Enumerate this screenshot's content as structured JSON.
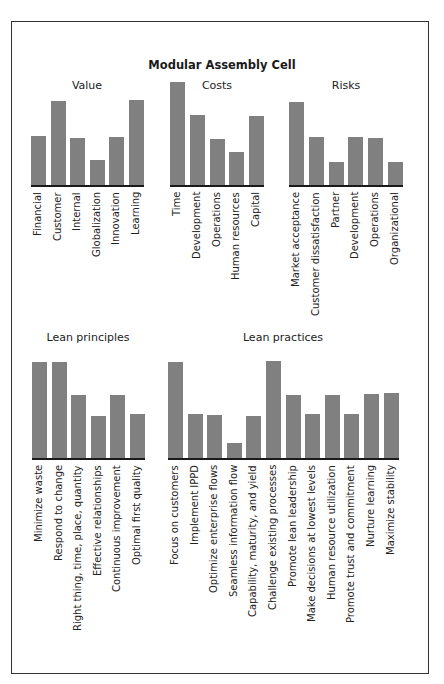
{
  "figure": {
    "title": "Modular Assembly Cell"
  },
  "chart_data": [
    {
      "type": "bar",
      "title": "Value",
      "categories": [
        "Financial",
        "Customer",
        "Internal",
        "Globalization",
        "Innovation",
        "Learning"
      ],
      "values": [
        2.4,
        4.1,
        2.3,
        1.2,
        2.35,
        4.15
      ],
      "xlabel": "",
      "ylabel": "",
      "ylim": [
        0,
        5
      ],
      "grid": false
    },
    {
      "type": "bar",
      "title": "Costs",
      "categories": [
        "Time",
        "Development",
        "Operations",
        "Human resources",
        "Capital"
      ],
      "values": [
        5.0,
        3.4,
        2.25,
        1.6,
        3.35
      ],
      "xlabel": "",
      "ylabel": "",
      "ylim": [
        0,
        5
      ],
      "grid": false
    },
    {
      "type": "bar",
      "title": "Risks",
      "categories": [
        "Market acceptance",
        "Customer dissatisfaction",
        "Partner",
        "Development",
        "Operations",
        "Organizational"
      ],
      "values": [
        4.05,
        2.35,
        1.1,
        2.35,
        2.3,
        1.1
      ],
      "xlabel": "",
      "ylabel": "",
      "ylim": [
        0,
        5
      ],
      "grid": false
    },
    {
      "type": "bar",
      "title": "Lean principles",
      "categories": [
        "Minimize waste",
        "Respond to change",
        "Right thing, time, place, quantity",
        "Effective relationships",
        "Continuous improvement",
        "Optimal first quality"
      ],
      "values": [
        5.0,
        5.0,
        3.3,
        2.2,
        3.3,
        2.3
      ],
      "xlabel": "",
      "ylabel": "",
      "ylim": [
        0,
        5
      ],
      "grid": false
    },
    {
      "type": "bar",
      "title": "Lean practices",
      "categories": [
        "Focus on customers",
        "Implement IPPD",
        "Optimize enterprise flows",
        "Seamless information flow",
        "Capability, maturity, and yield",
        "Challenge existing processes",
        "Promote lean leadership",
        "Make decisions at lowest levels",
        "Human resource utilization",
        "Promote trust and commitment",
        "Nurture learning",
        "Maximize stability"
      ],
      "values": [
        5.0,
        2.3,
        2.25,
        0.8,
        2.2,
        5.05,
        3.3,
        2.3,
        3.3,
        2.3,
        3.35,
        3.4
      ],
      "xlabel": "",
      "ylabel": "",
      "ylim": [
        0,
        5
      ],
      "grid": false
    }
  ],
  "style": {
    "bar_color": "#808080",
    "axis_color": "#1a1a1a",
    "frame_color": "#333333"
  }
}
